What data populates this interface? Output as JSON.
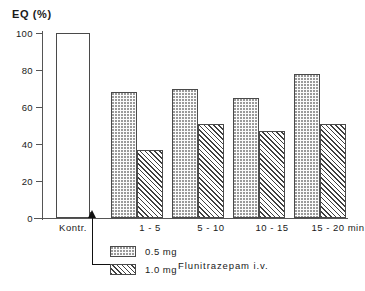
{
  "chart_data": {
    "type": "bar",
    "title": "",
    "ylabel": "EQ (%)",
    "xlabel": "",
    "ylim": [
      0,
      100
    ],
    "yticks": [
      0,
      20,
      40,
      60,
      80,
      100
    ],
    "ytick_labels": [
      "0",
      "20",
      "40",
      "60",
      "80",
      "100"
    ],
    "grid": false,
    "legend_position": "bottom-left",
    "categories": [
      "Kontr.",
      "1 - 5",
      "5 - 10",
      "10 - 15",
      "15 - 20 min"
    ],
    "series": [
      {
        "name": "Kontrolle",
        "fill": "none",
        "values": [
          100,
          null,
          null,
          null,
          null
        ]
      },
      {
        "name": "0.5 mg",
        "fill": "dots",
        "values": [
          null,
          68,
          70,
          65,
          78
        ]
      },
      {
        "name": "1.0 mg",
        "fill": "hatch",
        "values": [
          null,
          37,
          51,
          47,
          51
        ]
      }
    ],
    "legend_entries": [
      {
        "label": "0.5 mg",
        "fill": "dots"
      },
      {
        "label": "1.0 mg",
        "fill": "hatch"
      }
    ],
    "annotations": [
      {
        "text": "Flunitrazepam i.v.",
        "role": "drug-group-label"
      },
      {
        "text": "",
        "role": "injection-arrow"
      }
    ]
  },
  "bars": [
    {
      "name": "kontr-control",
      "group": "Kontr.",
      "series": "Kontrolle",
      "value": 100,
      "fill": "none",
      "left": 14,
      "width": 34
    },
    {
      "name": "g1-dose05",
      "group": "1 - 5",
      "series": "0.5 mg",
      "value": 68,
      "fill": "dots",
      "left": 69,
      "width": 26
    },
    {
      "name": "g1-dose10",
      "group": "1 - 5",
      "series": "1.0 mg",
      "value": 37,
      "fill": "hatch",
      "left": 95,
      "width": 26
    },
    {
      "name": "g2-dose05",
      "group": "5 - 10",
      "series": "0.5 mg",
      "value": 70,
      "fill": "dots",
      "left": 130,
      "width": 26
    },
    {
      "name": "g2-dose10",
      "group": "5 - 10",
      "series": "1.0 mg",
      "value": 51,
      "fill": "hatch",
      "left": 156,
      "width": 26
    },
    {
      "name": "g3-dose05",
      "group": "10 - 15",
      "series": "0.5 mg",
      "value": 65,
      "fill": "dots",
      "left": 191,
      "width": 26
    },
    {
      "name": "g3-dose10",
      "group": "10 - 15",
      "series": "1.0 mg",
      "value": 47,
      "fill": "hatch",
      "left": 217,
      "width": 26
    },
    {
      "name": "g4-dose05",
      "group": "15 - 20 min",
      "series": "0.5 mg",
      "value": 78,
      "fill": "dots",
      "left": 252,
      "width": 26
    },
    {
      "name": "g4-dose10",
      "group": "15 - 20 min",
      "series": "1.0 mg",
      "value": 51,
      "fill": "hatch",
      "left": 278,
      "width": 26
    }
  ],
  "xtick_positions": [
    42,
    56,
    90,
    111,
    137,
    172,
    198,
    233,
    259,
    294,
    320,
    342
  ],
  "xlabel_positions": [
    73,
    150,
    211,
    272,
    338
  ],
  "colors": {
    "axis": "#555555",
    "bar_outline": "#4a4a4a",
    "hatch": "#3f3f3f",
    "dots": "#9a9a9a",
    "text": "#1a1a1a"
  }
}
